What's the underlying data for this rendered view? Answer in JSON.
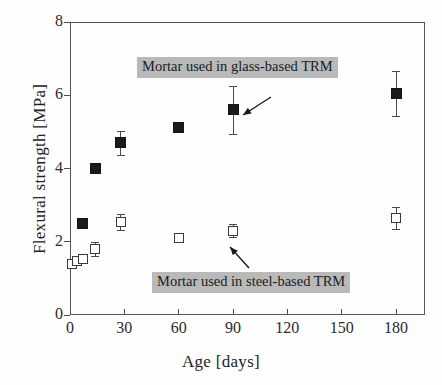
{
  "chart_data": {
    "type": "scatter",
    "title": "",
    "xlabel": "Age [days]",
    "ylabel": "Flexural strength [MPa]",
    "xlim": [
      0,
      196
    ],
    "ylim": [
      0,
      8
    ],
    "xticks": [
      0,
      30,
      60,
      90,
      120,
      150,
      180
    ],
    "yticks": [
      0,
      2,
      4,
      6,
      8
    ],
    "xtick_labels": [
      "0",
      "30",
      "60",
      "90",
      "120",
      "150",
      "180"
    ],
    "ytick_labels": [
      "0",
      "2",
      "4",
      "6",
      "8"
    ],
    "grid": false,
    "legend_position": "inline-annotations",
    "error_bars": "vertical, symmetric (std. dev.)",
    "series": [
      {
        "name": "Mortar used in glass-based TRM",
        "marker": "filled-square",
        "marker_color": "#1b1b1b",
        "points": [
          {
            "x": 7,
            "y": 2.5,
            "err": 0.12
          },
          {
            "x": 14,
            "y": 4.0,
            "err": 0.1
          },
          {
            "x": 28,
            "y": 4.7,
            "err": 0.32
          },
          {
            "x": 60,
            "y": 5.12,
            "err": 0.12
          },
          {
            "x": 90,
            "y": 5.6,
            "err": 0.66
          },
          {
            "x": 180,
            "y": 6.05,
            "err": 0.62
          }
        ]
      },
      {
        "name": "Mortar used in steel-based TRM",
        "marker": "open-square",
        "marker_color": "#ffffff",
        "points": [
          {
            "x": 1,
            "y": 1.4,
            "err": 0.1
          },
          {
            "x": 4,
            "y": 1.47,
            "err": 0.09
          },
          {
            "x": 7,
            "y": 1.52,
            "err": 0.08
          },
          {
            "x": 14,
            "y": 1.8,
            "err": 0.2
          },
          {
            "x": 28,
            "y": 2.55,
            "err": 0.22
          },
          {
            "x": 60,
            "y": 2.1,
            "err": 0.12
          },
          {
            "x": 90,
            "y": 2.3,
            "err": 0.18
          },
          {
            "x": 180,
            "y": 2.65,
            "err": 0.3
          }
        ]
      }
    ],
    "annotations": [
      {
        "text": "Mortar used in glass-based TRM",
        "box_left": 137,
        "box_top": 57,
        "arrow_from_x": 271,
        "arrow_from_y": 97,
        "arrow_to_x": 243,
        "arrow_to_y": 115,
        "highlight_color": "#b9b9b9"
      },
      {
        "text": "Mortar used in steel-based TRM",
        "box_left": 152,
        "box_top": 272,
        "arrow_from_x": 249,
        "arrow_from_y": 268,
        "arrow_to_x": 230,
        "arrow_to_y": 247,
        "highlight_color": "#b9b9b9"
      }
    ]
  }
}
